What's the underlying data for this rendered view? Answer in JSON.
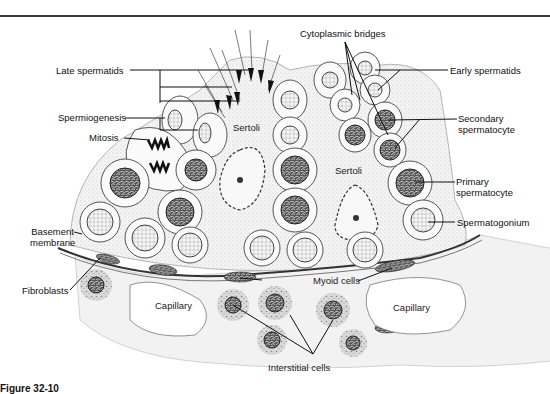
{
  "figure": {
    "caption_partial": "Figure 32-10",
    "labels_left": {
      "late_spermatids": "Late spermatids",
      "spermiogenesis": "Spermiogenesis",
      "mitosis": "Mitosis",
      "basement_membrane_1": "Basement",
      "basement_membrane_2": "membrane",
      "fibroblasts": "Fibroblasts"
    },
    "labels_top": {
      "cytoplasmic_bridges": "Cytoplasmic bridges"
    },
    "labels_right": {
      "early_spermatids": "Early spermatids",
      "secondary_spermatocyte_1": "Secondary",
      "secondary_spermatocyte_2": "spermatocyte",
      "primary_spermatocyte_1": "Primary",
      "primary_spermatocyte_2": "spermatocyte",
      "spermatogonium": "Spermatogonium"
    },
    "labels_inside": {
      "sertoli_left": "Sertoli",
      "sertoli_right": "Sertoli",
      "capillary_left": "Capillary",
      "capillary_right": "Capillary",
      "myoid_cells": "Myoid cells",
      "interstitial_cells": "Interstitial cells"
    }
  }
}
